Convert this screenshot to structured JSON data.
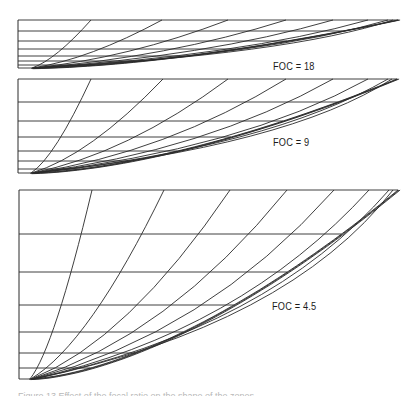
{
  "figure": {
    "background": "#ffffff",
    "line_color": "#2a2a2a",
    "panels": [
      {
        "id": "foc-18",
        "label": "FOC = 18",
        "label_pos": [
          273,
          61
        ],
        "left": 18,
        "top": 20,
        "bottom": 68,
        "tip_x": 398,
        "horizontals_y": [
          20,
          31,
          41,
          49,
          56,
          61,
          65,
          68
        ],
        "curve_top_x": [
          91,
          162,
          228,
          286,
          333,
          368,
          388,
          393
        ],
        "origin_x": 30
      },
      {
        "id": "foc-9",
        "label": "FOC = 9",
        "label_pos": [
          273,
          137
        ],
        "left": 18,
        "top": 79,
        "bottom": 173,
        "tip_x": 397,
        "horizontals_y": [
          79,
          102,
          121,
          137,
          151,
          161,
          169,
          173
        ],
        "curve_top_x": [
          91,
          163,
          228,
          286,
          333,
          368,
          388,
          392
        ],
        "origin_x": 29
      },
      {
        "id": "foc-4.5",
        "label": "FOC = 4.5",
        "label_pos": [
          272,
          301
        ],
        "left": 19,
        "top": 190,
        "bottom": 379,
        "tip_x": 398,
        "horizontals_y": [
          190,
          234,
          272,
          305,
          332,
          353,
          368,
          379
        ],
        "curve_top_x": [
          92,
          164,
          230,
          287,
          334,
          369,
          389,
          393
        ],
        "origin_x": 28
      }
    ],
    "caption": "Figure 13  Effect of the focal ratio on the shape of the zones..."
  }
}
